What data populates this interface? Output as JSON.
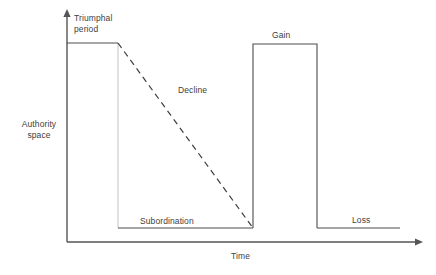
{
  "diagram": {
    "colors": {
      "axis": "#555555",
      "curve": "#4d4d4d",
      "guide": "#b3b3b3",
      "text": "#404040",
      "background": "#ffffff"
    },
    "axes": {
      "y_label_line1": "Authority",
      "y_label_line2": "space",
      "x_label": "Time",
      "y_axis": {
        "x": 67,
        "y_bottom": 242,
        "y_top": 10,
        "arrow": "up"
      },
      "x_axis": {
        "y": 242,
        "x_left": 67,
        "x_right": 422,
        "arrow": "right"
      }
    },
    "labels": {
      "triumphal_line1": "Triumphal",
      "triumphal_line2": "period",
      "decline": "Decline",
      "subordination": "Subordination",
      "gain": "Gain",
      "loss": "Loss"
    },
    "segments": [
      {
        "name": "triumphal-plateau",
        "style": "solid",
        "points": "67,43 118,43"
      },
      {
        "name": "decline-dashed",
        "style": "dashed",
        "points": "118,43 253,228"
      },
      {
        "name": "subordination-level",
        "style": "solid",
        "points": "118,228 253,228"
      },
      {
        "name": "gain-riser",
        "style": "solid",
        "points": "253,228 253,44"
      },
      {
        "name": "gain-plateau",
        "style": "solid",
        "points": "253,44 317,44"
      },
      {
        "name": "gain-faller",
        "style": "solid",
        "points": "317,44 317,228"
      },
      {
        "name": "loss-level",
        "style": "solid",
        "points": "317,228 400,228"
      },
      {
        "name": "triumphal-drop-guide",
        "style": "guide",
        "points": "118,43 118,228"
      }
    ]
  }
}
